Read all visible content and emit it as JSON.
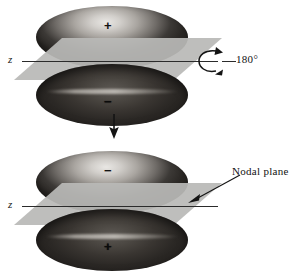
{
  "figure": {
    "colors": {
      "plane_gray": "#b9b9b7",
      "lobe_light": "#d2cfcb",
      "lobe_dark": "#39352f",
      "ink": "#141414",
      "background": "#ffffff"
    }
  },
  "diagram_top": {
    "name": "before-rotation",
    "axis_label": "z",
    "upper_lobe": {
      "sign": "+",
      "shading": "light"
    },
    "lower_lobe": {
      "sign": "−",
      "shading": "dark"
    },
    "rotation": {
      "icon": "curved-rotation-arrow-icon",
      "label": "180°"
    }
  },
  "transition": {
    "icon": "down-arrow-icon",
    "label": ""
  },
  "diagram_bottom": {
    "name": "after-rotation",
    "axis_label": "z",
    "upper_lobe": {
      "sign": "−",
      "shading": "light"
    },
    "lower_lobe": {
      "sign": "+",
      "shading": "dark"
    },
    "callout": {
      "label": "Nodal plane",
      "icon": "pointer-arrow-icon"
    }
  }
}
